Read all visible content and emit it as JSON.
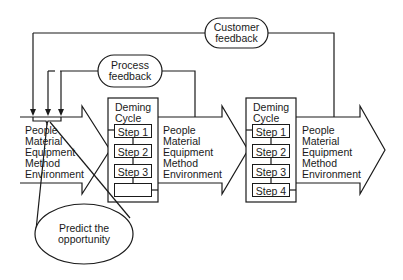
{
  "feedback": {
    "customer": {
      "line1": "Customer",
      "line2": "feedback"
    },
    "process": {
      "line1": "Process",
      "line2": "feedback"
    }
  },
  "input_resources": [
    "People",
    "Material",
    "Equipment",
    "Method",
    "Environment"
  ],
  "stage1": {
    "title_line1": "Deming",
    "title_line2": "Cycle",
    "steps": [
      "Step 1",
      "Step 2",
      "Step 3",
      ""
    ],
    "resources": [
      "People",
      "Material",
      "Equipment",
      "Method",
      "Environment"
    ]
  },
  "stage2": {
    "title_line1": "Deming",
    "title_line2": "Cycle",
    "steps": [
      "Step 1",
      "Step 2",
      "Step 3",
      "Step 4"
    ],
    "resources": [
      "People",
      "Material",
      "Equipment",
      "Method",
      "Environment"
    ]
  },
  "callout": {
    "line1": "Predict the",
    "line2": "opportunity"
  },
  "colors": {
    "line": "#1a1a1a",
    "background": "#ffffff"
  }
}
